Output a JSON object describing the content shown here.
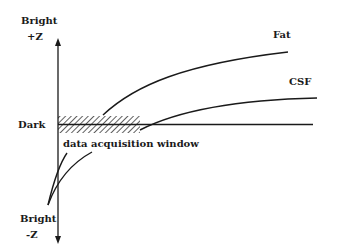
{
  "diagram": {
    "type": "relaxation-curve",
    "axis": {
      "top_label_line1": "Bright",
      "top_label_line2": "+Z",
      "middle_label": "Dark",
      "bottom_label_line1": "Bright",
      "bottom_label_line2": "-Z"
    },
    "curves": [
      {
        "name": "Fat",
        "label": "Fat"
      },
      {
        "name": "CSF",
        "label": "CSF"
      }
    ],
    "window_label": "data acquisition window",
    "colors": {
      "line": "#1a1a1a",
      "background": "#ffffff"
    }
  }
}
